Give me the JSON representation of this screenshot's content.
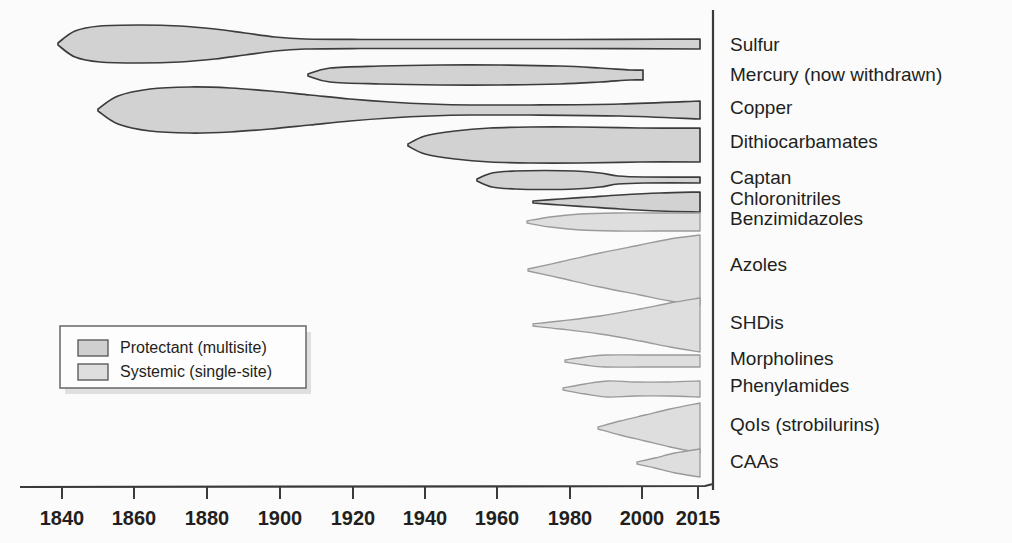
{
  "figure": {
    "title": "",
    "background_color": "#fbfbfb",
    "plot_right_edge": 700,
    "divider_x": 713
  },
  "colors": {
    "protectant_fill": "#d2d2d2",
    "protectant_stroke": "#3c3c3c",
    "systemic_fill": "#dedede",
    "systemic_stroke": "#9a9a9a",
    "text": "#231f20",
    "axis": "#3a3a3a"
  },
  "axis": {
    "label": "",
    "ticks": [
      {
        "label": "1840",
        "x": 62
      },
      {
        "label": "1860",
        "x": 134
      },
      {
        "label": "1880",
        "x": 207
      },
      {
        "label": "1900",
        "x": 280
      },
      {
        "label": "1920",
        "x": 353
      },
      {
        "label": "1940",
        "x": 425
      },
      {
        "label": "1960",
        "x": 497
      },
      {
        "label": "1980",
        "x": 570
      },
      {
        "label": "2000",
        "x": 642
      },
      {
        "label": "2015",
        "x": 698
      }
    ],
    "line_y": 487,
    "line_x_start": 20,
    "line_x_end": 713,
    "range": [
      1830,
      2015
    ]
  },
  "legend": {
    "x": 60,
    "y": 326,
    "width": 246,
    "height": 62,
    "items": [
      {
        "label": "Protectant (multisite)",
        "fill": "#cfcfcf",
        "stroke": "#4a4a4a"
      },
      {
        "label": "Systemic (single-site)",
        "fill": "#dedede",
        "stroke": "#8d8d8d"
      }
    ]
  },
  "chart_data": {
    "type": "area",
    "title": "",
    "xlabel": "",
    "ylabel": "",
    "xlim": [
      1830,
      2015
    ],
    "grid": false,
    "legend_position": "inner-left",
    "categories": [
      {
        "name": "Sulfur",
        "type": "Protectant (multisite)",
        "label_y": 44,
        "intro_year": 1840,
        "start_x": 58,
        "center_y": 44,
        "profile": [
          {
            "x": 58,
            "half": 1
          },
          {
            "x": 75,
            "half": 13
          },
          {
            "x": 100,
            "half": 18
          },
          {
            "x": 140,
            "half": 19
          },
          {
            "x": 180,
            "half": 18
          },
          {
            "x": 215,
            "half": 15
          },
          {
            "x": 245,
            "half": 11
          },
          {
            "x": 275,
            "half": 7
          },
          {
            "x": 305,
            "half": 5
          },
          {
            "x": 360,
            "half": 4.5
          },
          {
            "x": 450,
            "half": 4.5
          },
          {
            "x": 560,
            "half": 4.5
          },
          {
            "x": 700,
            "half": 5
          }
        ]
      },
      {
        "name": "Mercury (now withdrawn)",
        "type": "Protectant (multisite)",
        "label_y": 74,
        "intro_year": 1907,
        "start_x": 308,
        "center_y": 75,
        "profile": [
          {
            "x": 308,
            "half": 1
          },
          {
            "x": 330,
            "half": 7
          },
          {
            "x": 380,
            "half": 9
          },
          {
            "x": 440,
            "half": 10
          },
          {
            "x": 500,
            "half": 10
          },
          {
            "x": 560,
            "half": 9
          },
          {
            "x": 600,
            "half": 7
          },
          {
            "x": 630,
            "half": 5
          },
          {
            "x": 643,
            "half": 5
          }
        ]
      },
      {
        "name": "Copper",
        "type": "Protectant (multisite)",
        "label_y": 107,
        "intro_year": 1850,
        "start_x": 98,
        "center_y": 110,
        "profile": [
          {
            "x": 98,
            "half": 1
          },
          {
            "x": 118,
            "half": 14
          },
          {
            "x": 150,
            "half": 21
          },
          {
            "x": 190,
            "half": 23
          },
          {
            "x": 230,
            "half": 22
          },
          {
            "x": 270,
            "half": 19
          },
          {
            "x": 310,
            "half": 15
          },
          {
            "x": 350,
            "half": 11
          },
          {
            "x": 390,
            "half": 8
          },
          {
            "x": 430,
            "half": 6
          },
          {
            "x": 470,
            "half": 5
          },
          {
            "x": 530,
            "half": 5
          },
          {
            "x": 620,
            "half": 6
          },
          {
            "x": 700,
            "half": 9
          }
        ]
      },
      {
        "name": "Dithiocarbamates",
        "type": "Protectant (multisite)",
        "label_y": 141,
        "intro_year": 1934,
        "start_x": 408,
        "center_y": 145,
        "profile": [
          {
            "x": 408,
            "half": 1
          },
          {
            "x": 425,
            "half": 9
          },
          {
            "x": 455,
            "half": 14
          },
          {
            "x": 490,
            "half": 17
          },
          {
            "x": 530,
            "half": 18
          },
          {
            "x": 580,
            "half": 18
          },
          {
            "x": 640,
            "half": 17
          },
          {
            "x": 700,
            "half": 17
          }
        ]
      },
      {
        "name": "Captan",
        "type": "Protectant (multisite)",
        "label_y": 177,
        "intro_year": 1949,
        "start_x": 477,
        "center_y": 180,
        "profile": [
          {
            "x": 477,
            "half": 1
          },
          {
            "x": 492,
            "half": 7
          },
          {
            "x": 515,
            "half": 9
          },
          {
            "x": 545,
            "half": 9.5
          },
          {
            "x": 575,
            "half": 9
          },
          {
            "x": 600,
            "half": 7
          },
          {
            "x": 618,
            "half": 4
          },
          {
            "x": 645,
            "half": 3
          },
          {
            "x": 700,
            "half": 3
          }
        ]
      },
      {
        "name": "Chloronitriles",
        "type": "Protectant (multisite)",
        "label_y": 198,
        "intro_year": 1964,
        "start_x": 533,
        "center_y": 202,
        "profile": [
          {
            "x": 533,
            "half": 1
          },
          {
            "x": 560,
            "half": 3
          },
          {
            "x": 590,
            "half": 5
          },
          {
            "x": 620,
            "half": 7
          },
          {
            "x": 660,
            "half": 9
          },
          {
            "x": 700,
            "half": 10
          }
        ]
      },
      {
        "name": "Benzimidazoles",
        "type": "Systemic (single-site)",
        "label_y": 218,
        "intro_year": 1962,
        "start_x": 527,
        "center_y": 222,
        "profile": [
          {
            "x": 527,
            "half": 1
          },
          {
            "x": 550,
            "half": 5
          },
          {
            "x": 580,
            "half": 8
          },
          {
            "x": 615,
            "half": 9
          },
          {
            "x": 655,
            "half": 9
          },
          {
            "x": 700,
            "half": 9
          }
        ]
      },
      {
        "name": "Azoles",
        "type": "Systemic (single-site)",
        "label_y": 264,
        "intro_year": 1963,
        "start_x": 528,
        "center_y": 270,
        "profile": [
          {
            "x": 528,
            "half": 1
          },
          {
            "x": 560,
            "half": 8
          },
          {
            "x": 600,
            "half": 17
          },
          {
            "x": 640,
            "half": 25
          },
          {
            "x": 670,
            "half": 31
          },
          {
            "x": 700,
            "half": 35
          }
        ]
      },
      {
        "name": "SHDis",
        "type": "Systemic (single-site)",
        "label_y": 322,
        "intro_year": 1966,
        "start_x": 533,
        "center_y": 325,
        "profile": [
          {
            "x": 533,
            "half": 1
          },
          {
            "x": 560,
            "half": 4
          },
          {
            "x": 600,
            "half": 9
          },
          {
            "x": 640,
            "half": 16
          },
          {
            "x": 670,
            "half": 22
          },
          {
            "x": 700,
            "half": 27
          }
        ]
      },
      {
        "name": "Morpholines",
        "type": "Systemic (single-site)",
        "label_y": 358,
        "intro_year": 1975,
        "start_x": 565,
        "center_y": 361,
        "profile": [
          {
            "x": 565,
            "half": 1
          },
          {
            "x": 585,
            "half": 4
          },
          {
            "x": 605,
            "half": 6
          },
          {
            "x": 640,
            "half": 6
          },
          {
            "x": 670,
            "half": 6
          },
          {
            "x": 700,
            "half": 6
          }
        ]
      },
      {
        "name": "Phenylamides",
        "type": "Systemic (single-site)",
        "label_y": 385,
        "intro_year": 1974,
        "start_x": 563,
        "center_y": 389,
        "profile": [
          {
            "x": 563,
            "half": 1
          },
          {
            "x": 585,
            "half": 5
          },
          {
            "x": 608,
            "half": 8
          },
          {
            "x": 635,
            "half": 7
          },
          {
            "x": 668,
            "half": 7
          },
          {
            "x": 700,
            "half": 8
          }
        ]
      },
      {
        "name": "QoIs (strobilurins)",
        "type": "Systemic (single-site)",
        "label_y": 424,
        "intro_year": 1986,
        "start_x": 598,
        "center_y": 428,
        "profile": [
          {
            "x": 598,
            "half": 1
          },
          {
            "x": 620,
            "half": 7
          },
          {
            "x": 645,
            "half": 13
          },
          {
            "x": 670,
            "half": 19
          },
          {
            "x": 700,
            "half": 25
          }
        ]
      },
      {
        "name": "CAAs",
        "type": "Systemic (single-site)",
        "label_y": 461,
        "intro_year": 1997,
        "start_x": 637,
        "center_y": 463,
        "profile": [
          {
            "x": 637,
            "half": 1
          },
          {
            "x": 655,
            "half": 5
          },
          {
            "x": 675,
            "half": 10
          },
          {
            "x": 700,
            "half": 14
          }
        ]
      }
    ]
  }
}
